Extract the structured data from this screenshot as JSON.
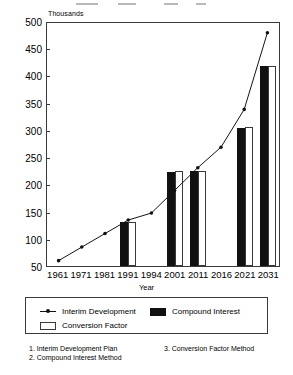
{
  "chart_data": {
    "type": "bar",
    "title": "",
    "subtitle": "",
    "unit_label": "Thousands",
    "xlabel": "Year",
    "ylabel": "",
    "ylim": [
      50,
      500
    ],
    "ytick_step": 50,
    "grid": false,
    "legend_position": "below-plot",
    "categories": [
      "1961",
      "1971",
      "1981",
      "1991",
      "1994",
      "2001",
      "2011",
      "2016",
      "2021",
      "2031"
    ],
    "yticks": [
      "50",
      "100",
      "150",
      "200",
      "250",
      "300",
      "350",
      "400",
      "450",
      "500"
    ],
    "series": [
      {
        "name": "Interim Development",
        "type": "line",
        "marker": "dot",
        "color": "#111111",
        "values": [
          60,
          85,
          110,
          135,
          148,
          190,
          232,
          270,
          340,
          482
        ]
      },
      {
        "name": "Compound Interest",
        "type": "bar",
        "fill": "solid",
        "color": "#111111",
        "values": [
          null,
          null,
          null,
          130,
          null,
          222,
          225,
          null,
          303,
          418
        ]
      },
      {
        "name": "Conversion Factor",
        "type": "bar",
        "fill": "hollow",
        "color": "#ffffff",
        "values": [
          null,
          null,
          null,
          130,
          null,
          225,
          225,
          null,
          305,
          418
        ]
      }
    ]
  },
  "legend": {
    "items": [
      {
        "label": "Interim Development",
        "swatch": "line-marker"
      },
      {
        "label": "Compound Interest",
        "swatch": "solid-bar"
      },
      {
        "label": "Conversion Factor",
        "swatch": "hollow-bar"
      }
    ]
  },
  "footnotes": {
    "left": [
      "1. Interim Development Plan",
      "2. Compound Interest Method"
    ],
    "right": [
      "3. Conversion Factor Method"
    ]
  }
}
